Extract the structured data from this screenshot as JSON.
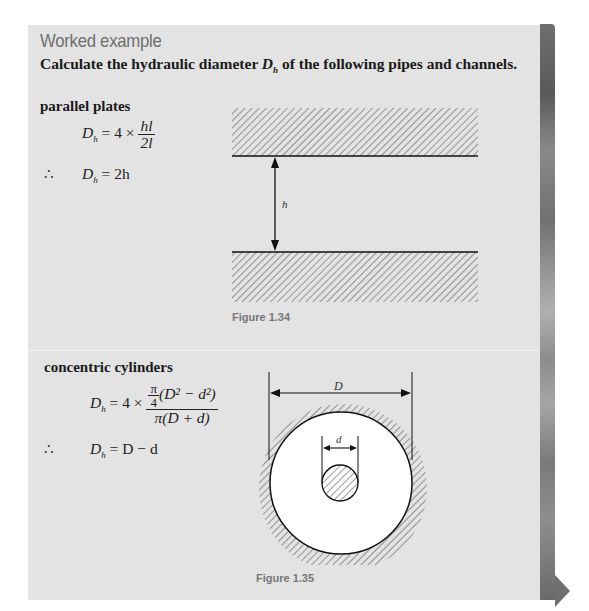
{
  "header": {
    "title": "Worked example",
    "intro_prefix": "Calculate the hydraulic diameter ",
    "intro_symbol": "D",
    "intro_symbol_sub": "h",
    "intro_suffix": " of the following pipes and channels."
  },
  "sections": [
    {
      "heading": "parallel plates",
      "equations": [
        {
          "lhs": "D",
          "lhs_sub": "h",
          "rhs_prefix": " = 4 × ",
          "numerator": "hl",
          "denominator": "2l"
        },
        {
          "therefore": "∴",
          "lhs": "D",
          "lhs_sub": "h",
          "rhs": " = 2h"
        }
      ],
      "figure": {
        "caption": "Figure 1.34",
        "dimension_label": "h"
      }
    },
    {
      "heading": "concentric cylinders",
      "equations": [
        {
          "lhs": "D",
          "lhs_sub": "h",
          "rhs_prefix": " = 4 × ",
          "numerator_coef_num": "π",
          "numerator_coef_den": "4",
          "numerator_rest": "(D² − d²)",
          "denominator": "π(D + d)"
        },
        {
          "therefore": "∴",
          "lhs": "D",
          "lhs_sub": "h",
          "rhs": " = D − d"
        }
      ],
      "figure": {
        "caption": "Figure 1.35",
        "outer_label": "D",
        "inner_label": "d"
      }
    }
  ],
  "navigation": {
    "next_icon": "triangle-right-icon"
  },
  "colors": {
    "panel_bg": "#e3e3e3",
    "title": "#6e6e6e",
    "caption": "#777777",
    "strip": "#7a7a7a"
  }
}
